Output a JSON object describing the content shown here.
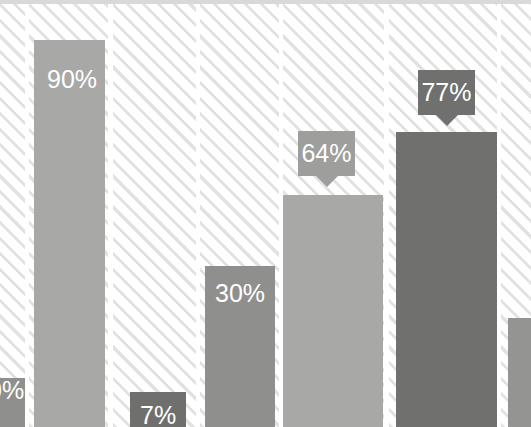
{
  "chart_data": {
    "type": "bar",
    "title": "",
    "xlabel": "",
    "ylabel": "",
    "ylim": [
      0,
      100
    ],
    "grid": false,
    "legend": "none",
    "categories": [
      "",
      "",
      "",
      "",
      "",
      "",
      ""
    ],
    "values": [
      12,
      90,
      7,
      30,
      64,
      77,
      22
    ],
    "data_labels": [
      "0%",
      "90%",
      "7%",
      "30%",
      "64%",
      "77%",
      ""
    ],
    "label_style": [
      "inside",
      "inside",
      "inside",
      "inside",
      "callout",
      "callout",
      "none"
    ],
    "bar_colors": [
      "#8f8f8e",
      "#a8a8a7",
      "#6f6f6e",
      "#8f8f8e",
      "#a8a8a7",
      "#70706f",
      "#949493"
    ]
  },
  "colors": {
    "background": "#ffffff",
    "stripe": "#e2e2e2",
    "top_rule": "#d9d9d9",
    "label_text": "#ffffff",
    "tooltip_dark": "#70706f",
    "tooltip_light": "#9e9e9d"
  },
  "bars": [
    {
      "name": "bar-1",
      "value": "0%",
      "label": "0%",
      "color": "#8f8f8e",
      "band": {
        "left": 0,
        "width": 25
      },
      "rect": {
        "left": 0,
        "width": 25,
        "top": 378
      },
      "label_pos": {
        "left": -12,
        "top": 378
      },
      "clipped": "left"
    },
    {
      "name": "bar-2",
      "value": "90%",
      "label": "90%",
      "color": "#a8a8a7",
      "band": {
        "left": 29,
        "width": 79
      },
      "rect": {
        "left": 34,
        "width": 71,
        "top": 40
      },
      "label_pos": {
        "left": 47,
        "top": 67
      },
      "clipped": "none"
    },
    {
      "name": "bar-3",
      "value": "7%",
      "label": "7%",
      "color": "#6f6f6e",
      "band": {
        "left": 113,
        "width": 83
      },
      "rect": {
        "left": 130,
        "width": 56,
        "top": 392
      },
      "label_pos": {
        "left": 140,
        "top": 403
      },
      "clipped": "none"
    },
    {
      "name": "bar-4",
      "value": "30%",
      "label": "30%",
      "color": "#8f8f8e",
      "band": {
        "left": 200,
        "width": 79
      },
      "rect": {
        "left": 205,
        "width": 70,
        "top": 266
      },
      "label_pos": {
        "left": 215,
        "top": 281
      },
      "clipped": "none"
    },
    {
      "name": "bar-5",
      "value": "64%",
      "label": "64%",
      "color": "#a8a8a7",
      "band": {
        "left": 283,
        "width": 101
      },
      "rect": {
        "left": 283,
        "width": 100,
        "top": 195
      },
      "tooltip": {
        "left": 298,
        "top": 131,
        "width": 57,
        "height": 45,
        "color": "#9e9e9d"
      },
      "clipped": "none"
    },
    {
      "name": "bar-6",
      "value": "77%",
      "label": "77%",
      "color": "#70706f",
      "band": {
        "left": 389,
        "width": 108
      },
      "rect": {
        "left": 396,
        "width": 101,
        "top": 132
      },
      "tooltip": {
        "left": 418,
        "top": 70,
        "width": 57,
        "height": 45,
        "color": "#70706f"
      },
      "clipped": "none"
    },
    {
      "name": "bar-7",
      "value": "",
      "label": "",
      "color": "#949493",
      "band": {
        "left": 501,
        "width": 30
      },
      "rect": {
        "left": 508,
        "width": 23,
        "top": 318
      },
      "clipped": "right"
    }
  ]
}
